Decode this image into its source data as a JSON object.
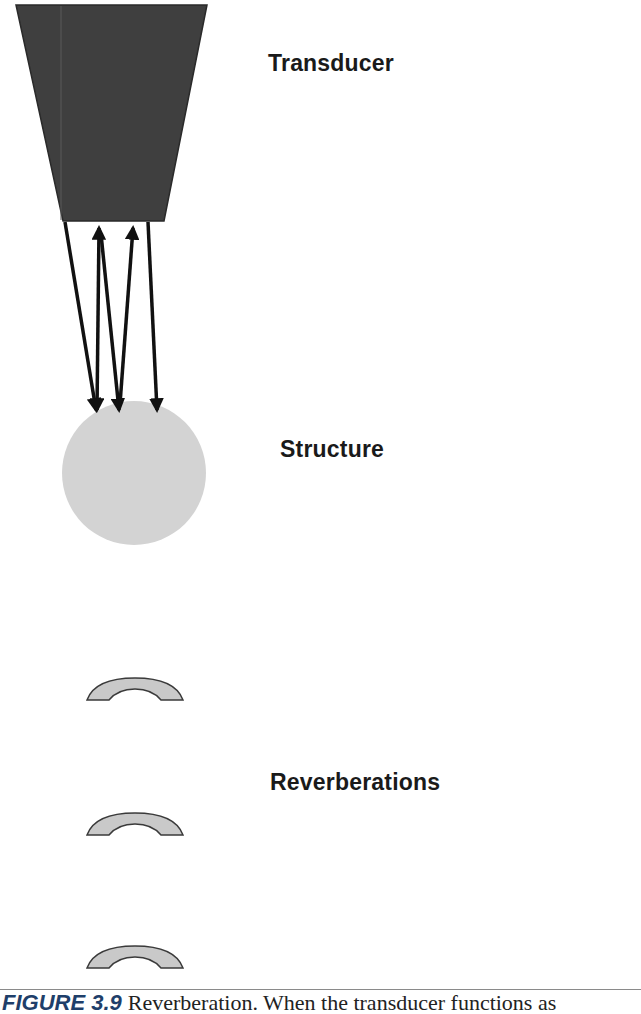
{
  "figure": {
    "labels": {
      "transducer": "Transducer",
      "structure": "Structure",
      "reverberations": "Reverberations"
    },
    "caption": {
      "number": "FIGURE 3.9",
      "text": "Reverberation. When the transducer functions as"
    },
    "colors": {
      "transducer_fill": "#3f3f3f",
      "structure_fill": "#d3d3d3",
      "reverberation_fill": "#c9c9c9",
      "arrow": "#111111",
      "caption_number": "#1f3f6a"
    },
    "elements": {
      "transducer": {
        "shape": "trapezoid",
        "top_left": [
          16,
          5
        ],
        "top_right": [
          207,
          5
        ],
        "bottom_right": [
          164,
          221
        ],
        "bottom_left": [
          63,
          221
        ]
      },
      "structure": {
        "shape": "circle",
        "center": [
          134,
          473
        ],
        "radius": 72
      },
      "reverberations": [
        {
          "shape": "arc",
          "top": 678
        },
        {
          "shape": "arc",
          "top": 813
        },
        {
          "shape": "arc",
          "top": 945
        }
      ],
      "beam_paths": [
        {
          "from": [
            65,
            222
          ],
          "to": [
            96,
            412
          ],
          "heads": [
            "end"
          ]
        },
        {
          "from": [
            99,
            226
          ],
          "to": [
            97,
            412
          ],
          "heads": [
            "start",
            "end"
          ]
        },
        {
          "from": [
            101,
            232
          ],
          "to": [
            119,
            412
          ],
          "heads": [
            "end"
          ]
        },
        {
          "from": [
            133,
            226
          ],
          "to": [
            120,
            412
          ],
          "heads": [
            "start"
          ]
        },
        {
          "from": [
            148,
            222
          ],
          "to": [
            157,
            412
          ],
          "heads": [
            "end"
          ]
        }
      ]
    }
  }
}
